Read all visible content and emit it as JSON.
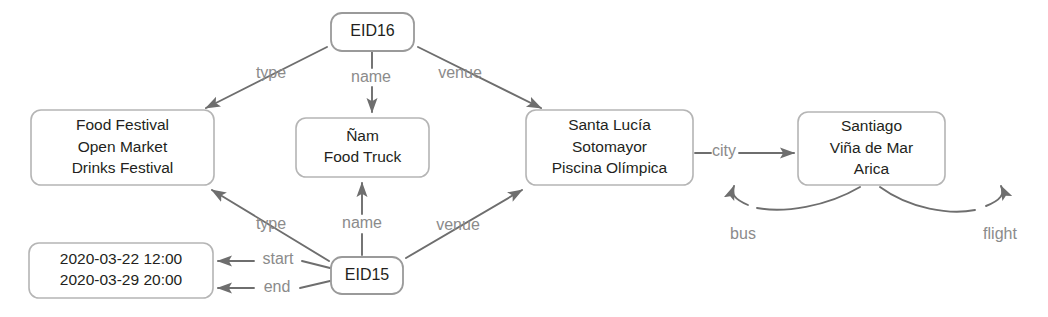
{
  "diagram": {
    "type": "knowledge-graph",
    "colors": {
      "node_border": "#b5b5b5",
      "node_fill": "#ffffff",
      "node_text": "#231f20",
      "edge_line": "#6e6e6e",
      "edge_label": "#8b8b8b",
      "background": "#ffffff"
    },
    "nodes": [
      {
        "id": "eid16",
        "name": "entity-node-eid16",
        "kind": "entity",
        "lines": [
          "EID16"
        ],
        "x": 331,
        "y": 13,
        "w": 83,
        "h": 38
      },
      {
        "id": "event-types",
        "name": "value-node-event-types",
        "kind": "value",
        "lines": [
          "Food Festival",
          "Open Market",
          "Drinks Festival"
        ],
        "x": 31,
        "y": 110,
        "w": 183,
        "h": 75
      },
      {
        "id": "event-names",
        "name": "value-node-event-names",
        "kind": "value",
        "lines": [
          "Ñam",
          "Food Truck"
        ],
        "x": 296,
        "y": 118,
        "w": 133,
        "h": 59
      },
      {
        "id": "venues",
        "name": "value-node-venues",
        "kind": "value",
        "lines": [
          "Santa Lucía",
          "Sotomayor",
          "Piscina Olímpica"
        ],
        "x": 526,
        "y": 110,
        "w": 167,
        "h": 75
      },
      {
        "id": "cities",
        "name": "value-node-cities",
        "kind": "value",
        "lines": [
          "Santiago",
          "Viña de Mar",
          "Arica"
        ],
        "x": 798,
        "y": 112,
        "w": 147,
        "h": 73
      },
      {
        "id": "timestamps",
        "name": "value-node-timestamps",
        "kind": "value",
        "lines": [
          "2020-03-22 12:00",
          "2020-03-29 20:00"
        ],
        "x": 29,
        "y": 243,
        "w": 184,
        "h": 55
      },
      {
        "id": "eid15",
        "name": "entity-node-eid15",
        "kind": "entity",
        "lines": [
          "EID15"
        ],
        "x": 331,
        "y": 257,
        "w": 72,
        "h": 37
      }
    ],
    "edges": [
      {
        "id": "eid16-type",
        "name": "edge-eid16-type",
        "label": "type",
        "from": "eid16",
        "to": "event-types",
        "path": "M 327,47 L 206,108",
        "arrow": "end",
        "label_x": 271,
        "label_y": 74
      },
      {
        "id": "eid16-name",
        "name": "edge-eid16-name",
        "label": "name",
        "from": "eid16",
        "to": "event-names",
        "path": "M 372,52 L 372,68 M 372,87 L 372,112",
        "arrow": "end",
        "label_x": 371,
        "label_y": 78
      },
      {
        "id": "eid16-venue",
        "name": "edge-eid16-venue",
        "label": "venue",
        "from": "eid16",
        "to": "venues",
        "path": "M 418,47 L 541,108",
        "arrow": "end",
        "label_x": 460,
        "label_y": 74
      },
      {
        "id": "venues-city",
        "name": "edge-venues-city",
        "label": "city",
        "from": "venues",
        "to": "cities",
        "path": "M 695,153 L 711,153 M 739,153 L 794,153",
        "arrow": "end",
        "label_x": 724,
        "label_y": 152
      },
      {
        "id": "eid15-type",
        "name": "edge-eid15-type",
        "label": "type",
        "from": "eid15",
        "to": "event-types",
        "path": "M 329,261 L 212,190",
        "arrow": "end",
        "label_x": 271,
        "label_y": 225
      },
      {
        "id": "eid15-name",
        "name": "edge-eid15-name",
        "label": "name",
        "from": "eid15",
        "to": "event-names",
        "path": "M 362,255 L 362,234 M 362,214 L 362,183",
        "arrow": "end",
        "label_x": 362,
        "label_y": 224
      },
      {
        "id": "eid15-venue",
        "name": "edge-eid15-venue",
        "label": "venue",
        "from": "eid15",
        "to": "venues",
        "path": "M 406,258 L 522,190",
        "arrow": "end",
        "label_x": 458,
        "label_y": 226
      },
      {
        "id": "eid15-start",
        "name": "edge-eid15-start",
        "label": "start",
        "from": "eid15",
        "to": "timestamps",
        "path": "M 330,268 L 302,261 M 254,261 L 218,261",
        "arrow": "end",
        "label_x": 278,
        "label_y": 260
      },
      {
        "id": "eid15-end",
        "name": "edge-eid15-end",
        "label": "end",
        "from": "eid15",
        "to": "timestamps",
        "path": "M 330,281 L 300,288 M 254,288 L 218,288",
        "arrow": "end",
        "label_x": 277,
        "label_y": 288
      },
      {
        "id": "cities-bus",
        "name": "edge-cities-bus-loop",
        "label": "bus",
        "from": "cities",
        "to": "cities",
        "path": "M 860,187 C 826,207 784,213 757,208 M 748,205 C 734,199 731,194 734,186",
        "arrow": "end-reverse",
        "label_x": 743,
        "label_y": 235
      },
      {
        "id": "cities-flight",
        "name": "edge-cities-flight-loop",
        "label": "flight",
        "from": "cities",
        "to": "cities",
        "path": "M 880,187 C 910,209 950,215 975,210 M 986,206 C 1001,200 1005,194 1001,186",
        "arrow": "end-reverse",
        "label_x": 1000,
        "label_y": 235
      }
    ]
  }
}
